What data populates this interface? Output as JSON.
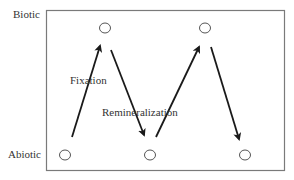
{
  "diagram": {
    "y_labels": {
      "top": "Biotic",
      "bottom": "Abiotic"
    },
    "arrow_labels": {
      "fixation": "Fixation",
      "remineralization": "Remineralization"
    },
    "colors": {
      "frame": "#7a7a7a",
      "arrow": "#1a1a1a",
      "node": "#555555",
      "text": "#333333"
    },
    "nodes": [
      {
        "id": "abiotic-1",
        "level": "abiotic",
        "x": 65,
        "y": 155
      },
      {
        "id": "biotic-1",
        "level": "biotic",
        "x": 105,
        "y": 28
      },
      {
        "id": "abiotic-2",
        "level": "abiotic",
        "x": 150,
        "y": 155
      },
      {
        "id": "biotic-2",
        "level": "biotic",
        "x": 205,
        "y": 28
      },
      {
        "id": "abiotic-3",
        "level": "abiotic",
        "x": 245,
        "y": 155
      }
    ],
    "arrows": [
      {
        "from": "abiotic-1",
        "to": "biotic-1",
        "process": "Fixation"
      },
      {
        "from": "biotic-1",
        "to": "abiotic-2",
        "process": "Remineralization"
      },
      {
        "from": "abiotic-2",
        "to": "biotic-2",
        "process": "Fixation"
      },
      {
        "from": "biotic-2",
        "to": "abiotic-3",
        "process": "Remineralization"
      }
    ]
  }
}
